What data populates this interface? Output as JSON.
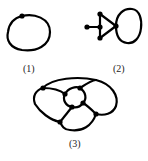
{
  "figure": {
    "graphs": [
      {
        "label": "(1)",
        "vertices": 1,
        "description": "single vertex with a loop"
      },
      {
        "label": "(2)",
        "vertices": 5,
        "description": "triangle with pendant vertex and loop at apex"
      },
      {
        "label": "(3)",
        "vertices": 7,
        "description": "outer cycle enclosing inner cycle with connecting edges"
      }
    ]
  }
}
